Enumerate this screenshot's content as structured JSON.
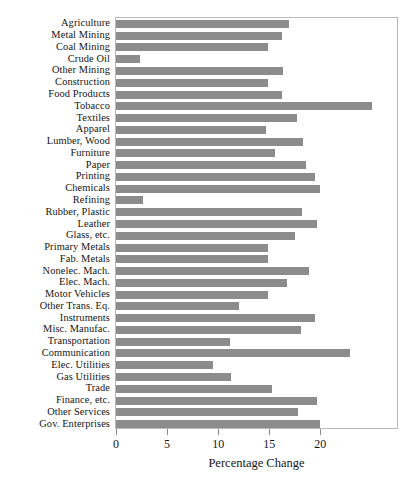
{
  "chart_data": {
    "type": "bar",
    "orientation": "horizontal",
    "title": "",
    "xlabel": "Percentage Change",
    "ylabel": "",
    "xlim": [
      0,
      27.5
    ],
    "xticks": [
      0,
      5,
      10,
      15,
      20
    ],
    "xticklabels": [
      "0",
      "5",
      "10",
      "15",
      "20"
    ],
    "grid": false,
    "legend": null,
    "bar_color": "#8c8c8c",
    "panel_border_color": "#b9b9b9",
    "categories": [
      "Agriculture",
      "Metal Mining",
      "Coal Mining",
      "Crude Oil",
      "Other Mining",
      "Construction",
      "Food Products",
      "Tobacco",
      "Textiles",
      "Apparel",
      "Lumber, Wood",
      "Furniture",
      "Paper",
      "Printing",
      "Chemicals",
      "Refining",
      "Rubber, Plastic",
      "Leather",
      "Glass, etc.",
      "Primary Metals",
      "Fab. Metals",
      "Nonelec. Mach.",
      "Elec. Mach.",
      "Motor Vehicles",
      "Other Trans. Eq.",
      "Instruments",
      "Misc. Manufac.",
      "Transportation",
      "Communication",
      "Elec. Utilities",
      "Gas Utilities",
      "Trade",
      "Finance, etc.",
      "Other Services",
      "Gov. Enterprises"
    ],
    "values": [
      16.9,
      16.2,
      14.9,
      2.3,
      16.3,
      14.9,
      16.2,
      25.1,
      17.7,
      14.7,
      18.3,
      15.6,
      18.6,
      19.5,
      20.0,
      2.6,
      18.2,
      19.7,
      17.5,
      14.9,
      14.9,
      18.9,
      16.7,
      14.9,
      12.0,
      19.5,
      18.1,
      11.2,
      22.9,
      9.5,
      11.3,
      15.3,
      19.7,
      17.8,
      20.0
    ]
  },
  "caption": ""
}
